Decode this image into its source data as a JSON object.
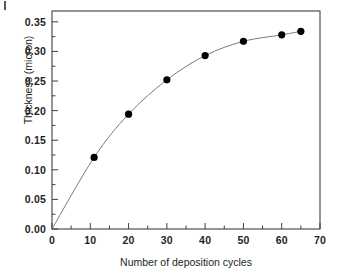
{
  "figure": {
    "background_color": "#ffffff",
    "frame_color": "#3f3f3f",
    "marker_color": "#000000",
    "line_color": "#6b6b6b",
    "corner_artifact": "scan-mark"
  },
  "chart_data": {
    "type": "line",
    "title": "",
    "subtitle": "",
    "xlabel": "Number of deposition cycles",
    "ylabel": "Thickness (micron)",
    "xlim": [
      0,
      70
    ],
    "ylim": [
      0.0,
      0.3683
    ],
    "xticks": [
      0,
      10,
      20,
      30,
      40,
      50,
      60,
      70
    ],
    "xtick_labels": [
      "0",
      "10",
      "20",
      "30",
      "40",
      "50",
      "60",
      "70"
    ],
    "yticks": [
      0.0,
      0.05,
      0.1,
      0.15,
      0.2,
      0.25,
      0.3,
      0.35
    ],
    "ytick_labels": [
      "0.00",
      "0.05",
      "0.10",
      "0.15",
      "0.20",
      "0.25",
      "0.30",
      "0.35"
    ],
    "xminor_ticks": [
      5,
      15,
      25,
      35,
      45,
      55,
      65
    ],
    "yminor_ticks": [
      0.025,
      0.075,
      0.125,
      0.175,
      0.225,
      0.275,
      0.325
    ],
    "grid": false,
    "legend": null,
    "marker": "filled-circle",
    "marker_size": 6,
    "series": [
      {
        "name": "Thickness vs deposition cycles",
        "x": [
          0,
          11,
          20,
          30,
          40,
          50,
          60,
          65
        ],
        "y": [
          0.0,
          0.121,
          0.194,
          0.252,
          0.293,
          0.317,
          0.328,
          0.334
        ]
      }
    ],
    "points": [
      {
        "x": 0,
        "y": 0.0,
        "marker": false
      },
      {
        "x": 11,
        "y": 0.121,
        "marker": true
      },
      {
        "x": 20,
        "y": 0.194,
        "marker": true
      },
      {
        "x": 30,
        "y": 0.252,
        "marker": true
      },
      {
        "x": 40,
        "y": 0.293,
        "marker": true
      },
      {
        "x": 50,
        "y": 0.317,
        "marker": true
      },
      {
        "x": 60,
        "y": 0.328,
        "marker": true
      },
      {
        "x": 65,
        "y": 0.334,
        "marker": true
      }
    ]
  }
}
